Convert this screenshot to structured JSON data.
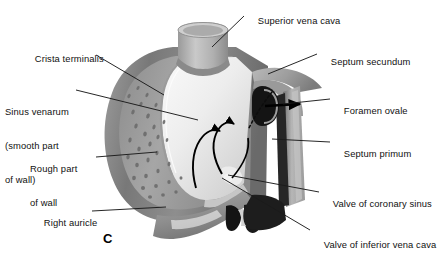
{
  "figure": {
    "panel_letter": "C",
    "background_color": "#ffffff",
    "line_color": "#1a1a1a",
    "text_color": "#111111"
  },
  "labels": [
    {
      "id": "superior-vena-cava",
      "text": "Superior vena cava",
      "lines": [
        "Superior vena cava"
      ],
      "side": "right",
      "x": 247,
      "y": 4,
      "leader": {
        "x1": 244,
        "y1": 16,
        "x2": 212,
        "y2": 47
      }
    },
    {
      "id": "crista-terminalis",
      "text": "Crista terminalis",
      "lines": [
        "Crista terminalis"
      ],
      "side": "left",
      "x": 24,
      "y": 42,
      "leader": {
        "x1": 96,
        "y1": 55,
        "x2": 164,
        "y2": 95
      }
    },
    {
      "id": "septum-secundum",
      "text": "Septum secundum",
      "lines": [
        "Septum secundum"
      ],
      "side": "right",
      "x": 320,
      "y": 45,
      "leader": {
        "x1": 317,
        "y1": 54,
        "x2": 268,
        "y2": 74
      }
    },
    {
      "id": "sinus-venarum",
      "text": "Sinus venarum (smooth part of wall)",
      "lines": [
        "Sinus venarum",
        "(smooth part",
        "of wall)"
      ],
      "side": "left",
      "x": 5,
      "y": 84,
      "leader": {
        "x1": 76,
        "y1": 90,
        "x2": 198,
        "y2": 120
      }
    },
    {
      "id": "foramen-ovale",
      "text": "Foramen ovale",
      "lines": [
        "Foramen ovale"
      ],
      "side": "right",
      "x": 333,
      "y": 94,
      "leader": {
        "x1": 330,
        "y1": 99,
        "x2": 283,
        "y2": 104
      }
    },
    {
      "id": "septum-primum",
      "text": "Septum primum",
      "lines": [
        "Septum primum"
      ],
      "side": "right",
      "x": 333,
      "y": 137,
      "leader": {
        "x1": 330,
        "y1": 142,
        "x2": 272,
        "y2": 139
      }
    },
    {
      "id": "rough-part-of-wall",
      "text": "Rough part of wall",
      "lines": [
        "Rough part",
        "of wall"
      ],
      "side": "left",
      "x": 30,
      "y": 141,
      "leader": {
        "x1": 96,
        "y1": 157,
        "x2": 157,
        "y2": 152
      }
    },
    {
      "id": "valve-of-coronary-sinus",
      "text": "Valve of coronary sinus",
      "lines": [
        "Valve of coronary sinus"
      ],
      "side": "right",
      "x": 322,
      "y": 187,
      "leader": {
        "x1": 319,
        "y1": 192,
        "x2": 228,
        "y2": 175
      }
    },
    {
      "id": "right-auricle",
      "text": "Right auricle",
      "lines": [
        "Right auricle"
      ],
      "side": "left",
      "x": 33,
      "y": 206,
      "leader": {
        "x1": 92,
        "y1": 211,
        "x2": 166,
        "y2": 207
      }
    },
    {
      "id": "valve-of-inferior-vena-cava",
      "text": "Valve of inferior vena cava",
      "lines": [
        "Valve of inferior vena cava"
      ],
      "side": "right",
      "x": 313,
      "y": 228,
      "leader": {
        "x1": 310,
        "y1": 230,
        "x2": 222,
        "y2": 178
      }
    }
  ],
  "palette": {
    "outer_wall_dark": "#6e6e6e",
    "outer_wall_mid": "#8d8d8d",
    "rough_wall": "#9a9a9a",
    "smooth_wall_light": "#e6e6e6",
    "smooth_wall_pale": "#f0f0f0",
    "svc_body": "#b4b4b4",
    "svc_shade": "#8a8a8a",
    "septum_dark": "#1e1e1e",
    "septum_mid": "#a0a0a0",
    "septum_light": "#c8c8c8",
    "flow_arrow": "#000000",
    "leader": "#1a1a1a"
  },
  "flow_arrows": [
    {
      "id": "foramen-ovale-flow",
      "description": "blood flow through foramen ovale",
      "direction": "right"
    },
    {
      "id": "atrial-flow",
      "description": "blood flow curving upward within atrium",
      "direction": "up"
    }
  ]
}
